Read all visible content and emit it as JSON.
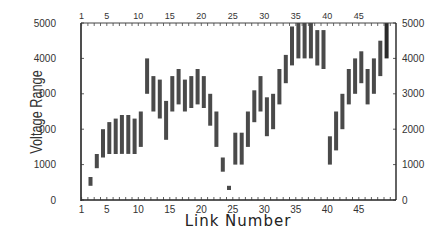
{
  "chart_data": {
    "type": "bar",
    "subtype": "floating-range",
    "title": "",
    "xlabel": "Link Number",
    "ylabel": "Voltage Range",
    "ylim": [
      0,
      5000
    ],
    "y2lim": [
      0,
      5000
    ],
    "xlim": [
      1,
      50
    ],
    "grid": false,
    "legend": null,
    "y_ticks": [
      0,
      1000,
      2000,
      3000,
      4000,
      5000
    ],
    "y_tick_labels": [
      "0",
      "1000",
      "2000",
      "3000",
      "4000",
      "5000"
    ],
    "y2_ticks": [
      0,
      1000,
      2000,
      3000,
      4000,
      5000
    ],
    "y2_tick_labels": [
      "0",
      "1000",
      "2000",
      "3000",
      "4000",
      "5000"
    ],
    "x_ticks": [
      1,
      5,
      10,
      15,
      20,
      25,
      30,
      35,
      40,
      45
    ],
    "x_tick_labels": [
      "1",
      "5",
      "10",
      "15",
      "20",
      "25",
      "30",
      "35",
      "40",
      "45"
    ],
    "series": [
      {
        "name": "Voltage Range",
        "color": "#4a4a4a",
        "ranges": [
          {
            "link": 2,
            "low": 400,
            "high": 650
          },
          {
            "link": 3,
            "low": 900,
            "high": 1300
          },
          {
            "link": 4,
            "low": 1200,
            "high": 2000
          },
          {
            "link": 5,
            "low": 1300,
            "high": 2200
          },
          {
            "link": 6,
            "low": 1300,
            "high": 2300
          },
          {
            "link": 7,
            "low": 1300,
            "high": 2400
          },
          {
            "link": 8,
            "low": 1300,
            "high": 2400
          },
          {
            "link": 9,
            "low": 1300,
            "high": 2300
          },
          {
            "link": 10,
            "low": 1500,
            "high": 2500
          },
          {
            "link": 11,
            "low": 3000,
            "high": 4000
          },
          {
            "link": 12,
            "low": 2500,
            "high": 3500
          },
          {
            "link": 13,
            "low": 2300,
            "high": 3400
          },
          {
            "link": 14,
            "low": 1700,
            "high": 2800
          },
          {
            "link": 15,
            "low": 2500,
            "high": 3500
          },
          {
            "link": 16,
            "low": 2700,
            "high": 3700
          },
          {
            "link": 17,
            "low": 2500,
            "high": 3400
          },
          {
            "link": 18,
            "low": 2600,
            "high": 3500
          },
          {
            "link": 19,
            "low": 2700,
            "high": 3700
          },
          {
            "link": 20,
            "low": 2600,
            "high": 3500
          },
          {
            "link": 21,
            "low": 2100,
            "high": 3000
          },
          {
            "link": 22,
            "low": 1500,
            "high": 2500
          },
          {
            "link": 23,
            "low": 800,
            "high": 1200
          },
          {
            "link": 24,
            "low": 280,
            "high": 400
          },
          {
            "link": 25,
            "low": 1000,
            "high": 1900
          },
          {
            "link": 26,
            "low": 1000,
            "high": 1900
          },
          {
            "link": 27,
            "low": 1500,
            "high": 2500
          },
          {
            "link": 28,
            "low": 2200,
            "high": 3100
          },
          {
            "link": 29,
            "low": 2500,
            "high": 3500
          },
          {
            "link": 30,
            "low": 1800,
            "high": 2900
          },
          {
            "link": 31,
            "low": 2000,
            "high": 3000
          },
          {
            "link": 32,
            "low": 2700,
            "high": 3700
          },
          {
            "link": 33,
            "low": 3300,
            "high": 4100
          },
          {
            "link": 34,
            "low": 3800,
            "high": 4900
          },
          {
            "link": 35,
            "low": 4000,
            "high": 5000
          },
          {
            "link": 36,
            "low": 4000,
            "high": 5000
          },
          {
            "link": 37,
            "low": 4000,
            "high": 5000
          },
          {
            "link": 38,
            "low": 3800,
            "high": 4800
          },
          {
            "link": 39,
            "low": 3700,
            "high": 4800
          },
          {
            "link": 40,
            "low": 1000,
            "high": 1800
          },
          {
            "link": 41,
            "low": 1400,
            "high": 2500
          },
          {
            "link": 42,
            "low": 2000,
            "high": 3000
          },
          {
            "link": 43,
            "low": 2700,
            "high": 3700
          },
          {
            "link": 44,
            "low": 3000,
            "high": 4000
          },
          {
            "link": 45,
            "low": 3300,
            "high": 4200
          },
          {
            "link": 46,
            "low": 2700,
            "high": 3700
          },
          {
            "link": 47,
            "low": 3000,
            "high": 4000
          },
          {
            "link": 48,
            "low": 3500,
            "high": 4500
          },
          {
            "link": 49,
            "low": 4000,
            "high": 5000,
            "color": "#2a2a2a"
          }
        ]
      }
    ]
  }
}
